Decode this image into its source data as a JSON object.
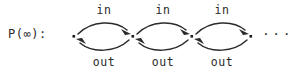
{
  "figure": {
    "prefix_label": "P(∞):",
    "ellipsis": "···",
    "node_count": 4,
    "ink_color": "#2b2b2b",
    "background_color": "#ffffff"
  },
  "edges": [
    {
      "in_label": "in",
      "out_label": "out",
      "from_node": 1,
      "to_node": 2
    },
    {
      "in_label": "in",
      "out_label": "out",
      "from_node": 2,
      "to_node": 3
    },
    {
      "in_label": "in",
      "out_label": "out",
      "from_node": 3,
      "to_node": 4
    }
  ]
}
